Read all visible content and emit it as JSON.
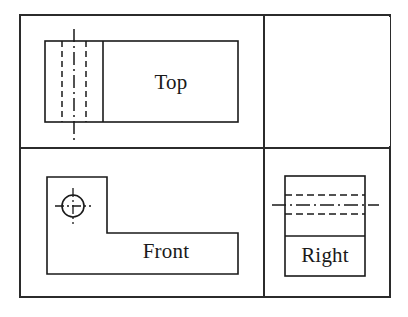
{
  "drawing": {
    "type": "orthographic-multiview-engineering-drawing",
    "projection": "third-angle",
    "canvas": {
      "width": 408,
      "height": 317
    },
    "colors": {
      "background": "#ffffff",
      "object_line": "#1a1a1a",
      "hidden_line": "#1a1a1a",
      "center_line": "#1a1a1a",
      "border_line": "#2b2b2b",
      "label_text": "#1a1a1a"
    },
    "border": {
      "name": "view-frame-border",
      "outer": {
        "x": 20,
        "y": 15,
        "width": 370,
        "height": 282
      },
      "vertical_divider_x": 264,
      "horizontal_divider_y": 148,
      "top_panel": {
        "x": 20,
        "y": 15,
        "width": 244,
        "height": 133
      },
      "front_panel": {
        "x": 20,
        "y": 148,
        "width": 244,
        "height": 149
      },
      "right_panel": {
        "x": 264,
        "y": 148,
        "width": 126,
        "height": 149
      },
      "stroke_width": 2
    },
    "views": [
      {
        "id": "top",
        "label": "Top",
        "label_position": {
          "x": 171,
          "y": 84
        },
        "outline": {
          "x": 45,
          "y": 41,
          "width": 193,
          "height": 81
        },
        "solid_edges": [
          {
            "name": "vertical-step-edge",
            "x1": 103,
            "y1": 41,
            "x2": 103,
            "y2": 122
          }
        ],
        "hidden_lines": [
          {
            "name": "hidden-hole-edge-left",
            "x1": 62,
            "y1": 41,
            "x2": 62,
            "y2": 122
          },
          {
            "name": "hidden-hole-edge-right",
            "x1": 86,
            "y1": 41,
            "x2": 86,
            "y2": 122
          }
        ],
        "center_lines": [
          {
            "name": "hole-center-line-vertical",
            "x1": 74,
            "y1": 29,
            "x2": 74,
            "y2": 140
          }
        ]
      },
      {
        "id": "front",
        "label": "Front",
        "label_position": {
          "x": 166,
          "y": 253
        },
        "outline_points": "47,177 107,177 107,233 238,233 238,274 47,274",
        "circle": {
          "name": "through-hole",
          "cx": 73,
          "cy": 206,
          "r": 11
        },
        "center_lines": [
          {
            "name": "hole-center-line-horizontal",
            "x1": 55,
            "y1": 206,
            "x2": 91,
            "y2": 206
          },
          {
            "name": "hole-center-line-vertical",
            "x1": 73,
            "y1": 188,
            "x2": 73,
            "y2": 224
          }
        ]
      },
      {
        "id": "right",
        "label": "Right",
        "label_position": {
          "x": 325,
          "y": 257
        },
        "outline": {
          "x": 285,
          "y": 176,
          "width": 80,
          "height": 100
        },
        "solid_edges": [
          {
            "name": "horizontal-step-edge",
            "x1": 285,
            "y1": 236,
            "x2": 365,
            "y2": 236
          }
        ],
        "hidden_lines": [
          {
            "name": "hidden-hole-edge-top",
            "x1": 285,
            "y1": 195,
            "x2": 365,
            "y2": 195
          },
          {
            "name": "hidden-hole-edge-bottom",
            "x1": 285,
            "y1": 214,
            "x2": 365,
            "y2": 214
          }
        ],
        "center_lines": [
          {
            "name": "hole-center-line-horizontal",
            "x1": 272,
            "y1": 205,
            "x2": 379,
            "y2": 205
          }
        ]
      }
    ]
  }
}
